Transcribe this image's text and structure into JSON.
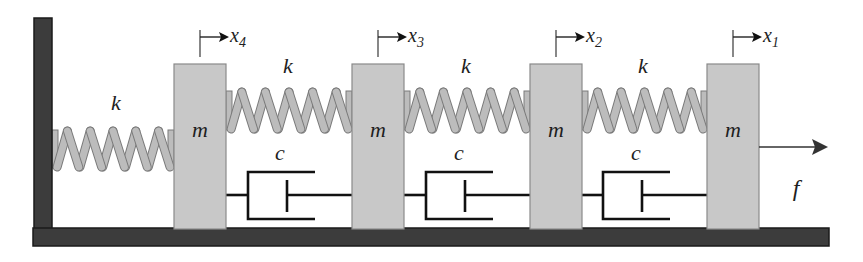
{
  "diagram": {
    "colors": {
      "wall": "#3c3c3c",
      "wall_edge": "#1a1a1a",
      "mass_fill": "#c8c8c8",
      "mass_edge": "#8a8a8a",
      "spring_fill": "#bcbcbc",
      "spring_edge": "#7a7a7a",
      "line": "#111111",
      "background": "#ffffff"
    },
    "wall": {
      "x": 34,
      "y": 18,
      "width": 18,
      "height": 212
    },
    "ground": {
      "x": 33,
      "y": 228,
      "width": 796,
      "height": 18
    },
    "masses": [
      {
        "id": "m4",
        "label": "m",
        "x": 174,
        "y": 64,
        "width": 52,
        "height": 165,
        "coordinate": "x",
        "coord_sub": "4",
        "marker_x": 200
      },
      {
        "id": "m3",
        "label": "m",
        "x": 352,
        "y": 64,
        "width": 52,
        "height": 165,
        "coordinate": "x",
        "coord_sub": "3",
        "marker_x": 378
      },
      {
        "id": "m2",
        "label": "m",
        "x": 530,
        "y": 64,
        "width": 52,
        "height": 165,
        "coordinate": "x",
        "coord_sub": "2",
        "marker_x": 556
      },
      {
        "id": "m1",
        "label": "m",
        "x": 707,
        "y": 64,
        "width": 52,
        "height": 165,
        "coordinate": "x",
        "coord_sub": "1",
        "marker_x": 733
      }
    ],
    "springs": [
      {
        "id": "k-wall-m4",
        "label": "k",
        "x1": 52,
        "x2": 174,
        "y_top": 126,
        "y_bot": 172,
        "coils": 5,
        "label_x": 116,
        "label_y": 110
      },
      {
        "id": "k-m4-m3",
        "label": "k",
        "x1": 226,
        "x2": 352,
        "y_top": 87,
        "y_bot": 134,
        "coils": 5,
        "label_x": 288,
        "label_y": 73
      },
      {
        "id": "k-m3-m2",
        "label": "k",
        "x1": 404,
        "x2": 530,
        "y_top": 87,
        "y_bot": 134,
        "coils": 5,
        "label_x": 466,
        "label_y": 73
      },
      {
        "id": "k-m2-m1",
        "label": "k",
        "x1": 582,
        "x2": 707,
        "y_top": 87,
        "y_bot": 134,
        "coils": 5,
        "label_x": 643,
        "label_y": 73
      }
    ],
    "dampers": [
      {
        "id": "c-m4-m3",
        "label": "c",
        "x_left": 226,
        "x_right": 352,
        "cyl_x": 248,
        "rail_end": 315,
        "piston_x": 287,
        "label_x": 280,
        "label_y": 160
      },
      {
        "id": "c-m3-m2",
        "label": "c",
        "x_left": 404,
        "x_right": 530,
        "cyl_x": 426,
        "rail_end": 493,
        "piston_x": 465,
        "label_x": 459,
        "label_y": 160
      },
      {
        "id": "c-m2-m1",
        "label": "c",
        "x_left": 582,
        "x_right": 707,
        "cyl_x": 603,
        "rail_end": 670,
        "piston_x": 642,
        "label_x": 636,
        "label_y": 160
      }
    ],
    "damper_geometry": {
      "rod_y": 195,
      "cyl_top": 172,
      "cyl_bot": 219,
      "piston_top": 180,
      "piston_bot": 212
    },
    "force": {
      "label": "f",
      "x1": 759,
      "x2": 826,
      "y": 147,
      "label_x": 796,
      "label_y": 196
    },
    "marker_geometry": {
      "line_top": 30,
      "line_bot": 57,
      "arrow_y": 37,
      "arrow_len": 27
    }
  }
}
